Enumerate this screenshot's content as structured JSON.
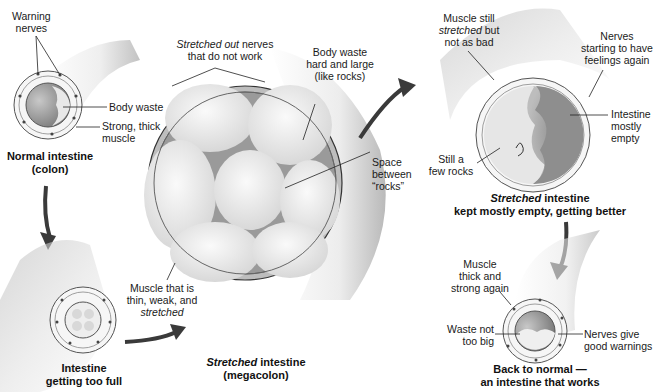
{
  "stages": [
    {
      "caption_lines": [
        "Normal intestine",
        "(colon)"
      ],
      "labels": {
        "warning_nerves": [
          "Warning",
          "nerves"
        ],
        "body_waste": "Body waste",
        "muscle": [
          "Strong, thick",
          "muscle"
        ]
      }
    },
    {
      "caption_lines": [
        "Intestine",
        "getting too full"
      ]
    },
    {
      "caption_italic": "Stretched",
      "caption_rest": " intestine",
      "caption_line2": "(megacolon)",
      "labels": {
        "nerves_italic": "Stretched out",
        "nerves_rest": " nerves",
        "nerves_line2": "that do not work",
        "waste": [
          "Body waste",
          "hard and large",
          "(like rocks)"
        ],
        "space": [
          "Space",
          "between",
          "“rocks”"
        ],
        "muscle": [
          "Muscle that is",
          "thin, weak, and"
        ],
        "muscle_italic": "stretched"
      }
    },
    {
      "caption_italic": "Stretched",
      "caption_rest": " intestine",
      "caption_line2": "kept mostly empty, getting better",
      "labels": {
        "muscle_line1": "Muscle still",
        "muscle_italic": "stretched",
        "muscle_rest": " but",
        "muscle_line3": "not as bad",
        "nerves": [
          "Nerves",
          "starting to have",
          "feelings again"
        ],
        "empty": [
          "Intestine",
          "mostly",
          "empty"
        ],
        "rocks": [
          "Still a",
          "few rocks"
        ]
      }
    },
    {
      "caption_lines": [
        "Back to normal —",
        "an intestine that works"
      ],
      "labels": {
        "muscle": [
          "Muscle",
          "thick and",
          "strong again"
        ],
        "waste": [
          "Waste not",
          "too big"
        ],
        "nerves": [
          "Nerves give",
          "good warnings"
        ]
      }
    }
  ],
  "colors": {
    "arrow": "#3a3a3a",
    "tube_shadow": "#b8b8b8",
    "waste_dark": "#8a8a8a",
    "rock": "#ececec"
  }
}
